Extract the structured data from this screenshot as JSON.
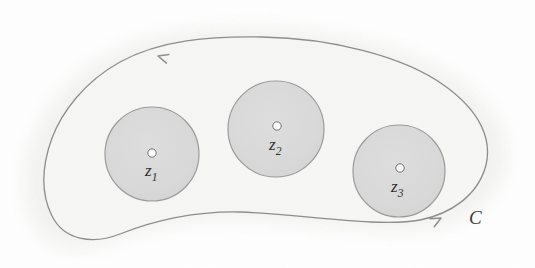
{
  "figure": {
    "type": "complex-analysis-contour-diagram",
    "orientation": "counterclockwise",
    "background_color": "#ffffff",
    "halo_color": "#f2f2f0",
    "region_fill": "#f7f7f6",
    "contour_stroke": "#8c8c8c",
    "contour_stroke_width": 1.3,
    "disk_fill": "#d9d9d9",
    "disk_stroke": "#9a9a9a",
    "disk_stroke_width": 1.2,
    "center_dot_fill": "#ffffff",
    "center_dot_stroke": "#6e6e6e",
    "label_color": "#2b2b2b"
  },
  "contour": {
    "name": "C",
    "label": "C",
    "label_x": 469,
    "label_y": 224,
    "label_font_size": 19,
    "path": "M 262 37 C 330 38 404 56 445 86 C 481 112 492 140 486 165 C 478 196 450 214 420 220 C 380 228 300 214 240 212 C 190 211 148 223 120 234 C 92 245 64 240 52 216 C 38 188 44 160 52 138 C 62 112 84 82 120 62 C 160 40 210 36 262 37 Z",
    "arrowheads": [
      {
        "name": "arrowhead-top-left",
        "x": 158,
        "y": 56,
        "angle": 196,
        "size": 11,
        "direction": "left"
      },
      {
        "name": "arrowhead-bottom-right",
        "x": 441,
        "y": 218,
        "angle": 332,
        "size": 11,
        "direction": "right"
      }
    ]
  },
  "disks": [
    {
      "id": "disk-z1",
      "cx": 152,
      "cy": 154,
      "r": 47,
      "point": {
        "name": "point-z1",
        "cx": 152,
        "cy": 153,
        "r": 4.2,
        "base": "z",
        "subscript": "1",
        "label_x": 145,
        "label_y": 176,
        "font_size": 17
      }
    },
    {
      "id": "disk-z2",
      "cx": 276,
      "cy": 129,
      "r": 48,
      "point": {
        "name": "point-z2",
        "cx": 277,
        "cy": 126,
        "r": 4.2,
        "base": "z",
        "subscript": "2",
        "label_x": 269,
        "label_y": 150,
        "font_size": 17
      }
    },
    {
      "id": "disk-z3",
      "cx": 399,
      "cy": 171,
      "r": 46,
      "point": {
        "name": "point-z3",
        "cx": 400,
        "cy": 168,
        "r": 4.2,
        "base": "z",
        "subscript": "3",
        "label_x": 391,
        "label_y": 192,
        "font_size": 17
      }
    }
  ]
}
